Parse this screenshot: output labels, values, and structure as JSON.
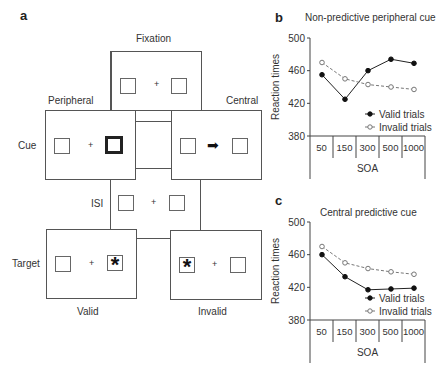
{
  "panel_a": {
    "letter": "a",
    "labels": {
      "fixation": "Fixation",
      "peripheral": "Peripheral",
      "central": "Central",
      "cue": "Cue",
      "isi": "ISI",
      "target": "Target",
      "valid": "Valid",
      "invalid": "Invalid"
    },
    "fixation_symbol": "+",
    "target_symbol": "*",
    "arrow_symbol": "➡"
  },
  "panel_b": {
    "letter": "b",
    "title": "Non-predictive peripheral cue"
  },
  "panel_c": {
    "letter": "c",
    "title": "Central predictive cue"
  },
  "chart_data": [
    {
      "type": "line",
      "panel": "b",
      "title": "Non-predictive peripheral cue",
      "xlabel": "SOA",
      "ylabel": "Reaction times",
      "categories": [
        "50",
        "150",
        "300",
        "500",
        "1000"
      ],
      "yticks": [
        380,
        420,
        460,
        500
      ],
      "ylim": [
        380,
        500
      ],
      "grid": false,
      "legend_position": "lower right",
      "series": [
        {
          "name": "Valid trials",
          "style": "solid, filled circle",
          "values": [
            455,
            425,
            460,
            474,
            469
          ]
        },
        {
          "name": "Invalid trials",
          "style": "dashed, open circle",
          "values": [
            470,
            450,
            443,
            440,
            437
          ]
        }
      ]
    },
    {
      "type": "line",
      "panel": "c",
      "title": "Central predictive cue",
      "xlabel": "SOA",
      "ylabel": "Reaction times",
      "categories": [
        "50",
        "150",
        "300",
        "500",
        "1000"
      ],
      "yticks": [
        380,
        420,
        460,
        500
      ],
      "ylim": [
        380,
        500
      ],
      "grid": false,
      "legend_position": "lower right",
      "series": [
        {
          "name": "Valid trials",
          "style": "solid, filled circle",
          "values": [
            460,
            433,
            417,
            418,
            419
          ]
        },
        {
          "name": "Invalid trials",
          "style": "dashed, open circle",
          "values": [
            470,
            450,
            443,
            439,
            436
          ]
        }
      ]
    }
  ]
}
